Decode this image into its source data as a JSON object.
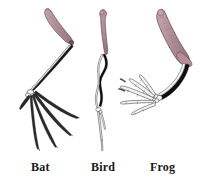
{
  "figure": {
    "background_color": "#ffffff"
  },
  "palette": {
    "humerus_pink": "#b08d96",
    "humerus_pink_dark": "#9a757f",
    "bone_outline": "#3a3a3a",
    "bone_fill_white": "#fbfbfb",
    "bone_black": "#111111",
    "label_color": "#1a1a1a"
  },
  "specimens": [
    {
      "id": "bat",
      "label": "Bat",
      "limb": "wing",
      "digit_count": 5,
      "humerus_color": "#b08d96"
    },
    {
      "id": "bird",
      "label": "Bird",
      "limb": "wing",
      "digit_count": 3,
      "humerus_color": "#b08d96"
    },
    {
      "id": "frog",
      "label": "Frog",
      "limb": "forelimb",
      "digit_count": 5,
      "humerus_color": "#b08d96"
    }
  ]
}
